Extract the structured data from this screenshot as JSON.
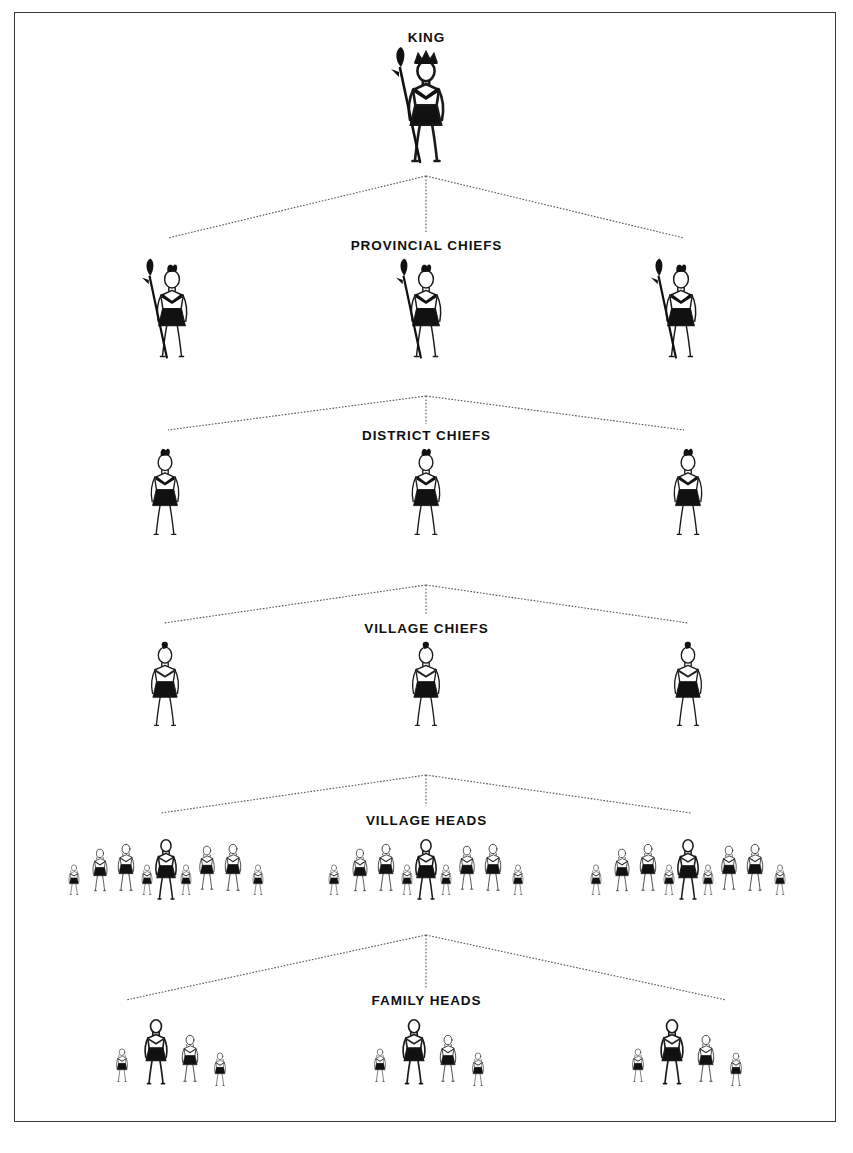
{
  "diagram": {
    "type": "hierarchy-pyramid",
    "frame": {
      "border_color": "#3a3a3a",
      "background": "#ffffff"
    },
    "connector": {
      "color": "#555555",
      "style": "dotted-thin"
    },
    "figure_colors": {
      "outline": "#1a1a1a",
      "fill_solid": "#111111",
      "fill_body": "#ffffff"
    },
    "levels": [
      {
        "id": "king",
        "label": "KING",
        "label_y": 30,
        "rank": 1,
        "count": 1,
        "figure_type": "king",
        "attributes": [
          "crown",
          "spear",
          "necklace",
          "skirt"
        ],
        "positions": [
          426
        ],
        "figure_y": 58,
        "figure_scale": 1.0
      },
      {
        "id": "provincial-chiefs",
        "label": "PROVINCIAL CHIEFS",
        "label_y": 238,
        "rank": 2,
        "count": 3,
        "figure_type": "chief-spear",
        "attributes": [
          "headdress",
          "spear",
          "skirt"
        ],
        "positions": [
          172,
          426,
          681
        ],
        "figure_y": 268,
        "figure_scale": 0.86
      },
      {
        "id": "district-chiefs",
        "label": "DISTRICT CHIEFS",
        "label_y": 428,
        "rank": 3,
        "count": 3,
        "figure_type": "chief-plain",
        "attributes": [
          "headdress",
          "skirt"
        ],
        "positions": [
          165,
          426,
          688
        ],
        "figure_y": 452,
        "figure_scale": 0.8
      },
      {
        "id": "village-chiefs",
        "label": "VILLAGE CHIEFS",
        "label_y": 621,
        "rank": 4,
        "count": 3,
        "figure_type": "chief-feather",
        "attributes": [
          "small-feather",
          "skirt"
        ],
        "positions": [
          165,
          426,
          688
        ],
        "figure_y": 645,
        "figure_scale": 0.78
      },
      {
        "id": "village-heads",
        "label": "VILLAGE HEADS",
        "label_y": 813,
        "rank": 5,
        "count": 3,
        "figure_type": "crowd-large",
        "attributes": [
          "bold-leader",
          "eight-followers"
        ],
        "positions": [
          166,
          426,
          688
        ],
        "figure_y": 838,
        "figure_scale": 0.74,
        "cluster_members": 9
      },
      {
        "id": "family-heads",
        "label": "FAMILY HEADS",
        "label_y": 993,
        "rank": 6,
        "count": 3,
        "figure_type": "crowd-small",
        "attributes": [
          "bold-leader",
          "three-followers"
        ],
        "positions": [
          168,
          426,
          684
        ],
        "figure_y": 1018,
        "figure_scale": 0.74,
        "cluster_members": 4
      }
    ],
    "connectors": [
      {
        "from": "king",
        "to": "provincial-chiefs",
        "apex_x": 426,
        "apex_y": 176,
        "spread": 258,
        "drop_y": 232,
        "arm_y": 238
      },
      {
        "from": "provincial-chiefs",
        "to": "district-chiefs",
        "apex_x": 426,
        "apex_y": 396,
        "spread": 258,
        "drop_y": 424,
        "arm_y": 430
      },
      {
        "from": "district-chiefs",
        "to": "village-chiefs",
        "apex_x": 426,
        "apex_y": 585,
        "spread": 262,
        "drop_y": 615,
        "arm_y": 623
      },
      {
        "from": "village-chiefs",
        "to": "village-heads",
        "apex_x": 426,
        "apex_y": 775,
        "spread": 265,
        "drop_y": 806,
        "arm_y": 813
      },
      {
        "from": "village-heads",
        "to": "family-heads",
        "apex_x": 426,
        "apex_y": 935,
        "spread": 300,
        "drop_y": 988,
        "arm_y": 1000
      }
    ]
  }
}
